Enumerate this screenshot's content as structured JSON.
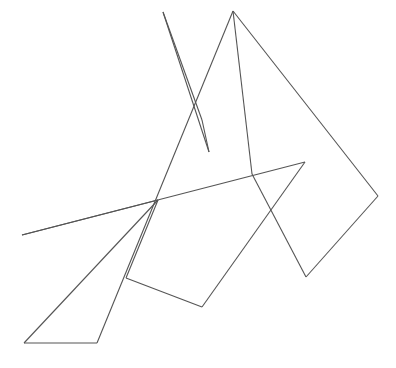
{
  "figure": {
    "title": "Abstract overlapping polygon line drawing",
    "width": 396,
    "height": 368,
    "background_color": "#ffffff",
    "stroke_color": "#555555",
    "stroke_width": 1.1,
    "fill": "none",
    "shapes": [
      {
        "name": "narrow-spike",
        "closed": true,
        "points": "163,12 196,112 209,152 202,120"
      },
      {
        "name": "long-slanted-band",
        "closed": true,
        "points": "233,11 97,343 24,343 158,200 126,278"
      },
      {
        "name": "dart-arrow-form",
        "closed": true,
        "points": "305,162 22,235 158,200 126,278 202,307 252,174"
      },
      {
        "name": "right-quadrilateral",
        "closed": false,
        "points": "233,11 378,196 306,277 252,174"
      }
    ],
    "segments": [
      {
        "name": "spike-left-edge",
        "x1": 163,
        "y1": 12,
        "x2": 209,
        "y2": 152
      },
      {
        "name": "spike-right-edge",
        "x1": 163,
        "y1": 12,
        "x2": 202,
        "y2": 120
      },
      {
        "name": "spike-inner-edge",
        "x1": 202,
        "y1": 120,
        "x2": 209,
        "y2": 152
      },
      {
        "name": "band-right-edge",
        "x1": 233,
        "y1": 11,
        "x2": 97,
        "y2": 343
      },
      {
        "name": "band-bottom-edge",
        "x1": 97,
        "y1": 343,
        "x2": 24,
        "y2": 343
      },
      {
        "name": "band-left-edge",
        "x1": 24,
        "y1": 343,
        "x2": 158,
        "y2": 200
      },
      {
        "name": "band-notch-edge",
        "x1": 158,
        "y1": 200,
        "x2": 126,
        "y2": 278
      },
      {
        "name": "dart-top-edge",
        "x1": 305,
        "y1": 162,
        "x2": 22,
        "y2": 235
      },
      {
        "name": "dart-left-edge",
        "x1": 22,
        "y1": 235,
        "x2": 158,
        "y2": 200
      },
      {
        "name": "dart-inner-edge",
        "x1": 126,
        "y1": 278,
        "x2": 202,
        "y2": 307
      },
      {
        "name": "dart-bottom-edge",
        "x1": 202,
        "y1": 307,
        "x2": 305,
        "y2": 162
      },
      {
        "name": "quad-top-right-edge",
        "x1": 233,
        "y1": 11,
        "x2": 378,
        "y2": 196
      },
      {
        "name": "quad-right-edge",
        "x1": 378,
        "y1": 196,
        "x2": 306,
        "y2": 277
      },
      {
        "name": "quad-bottom-edge",
        "x1": 306,
        "y1": 277,
        "x2": 252,
        "y2": 174
      },
      {
        "name": "quad-left-edge",
        "x1": 252,
        "y1": 174,
        "x2": 233,
        "y2": 11
      }
    ]
  }
}
